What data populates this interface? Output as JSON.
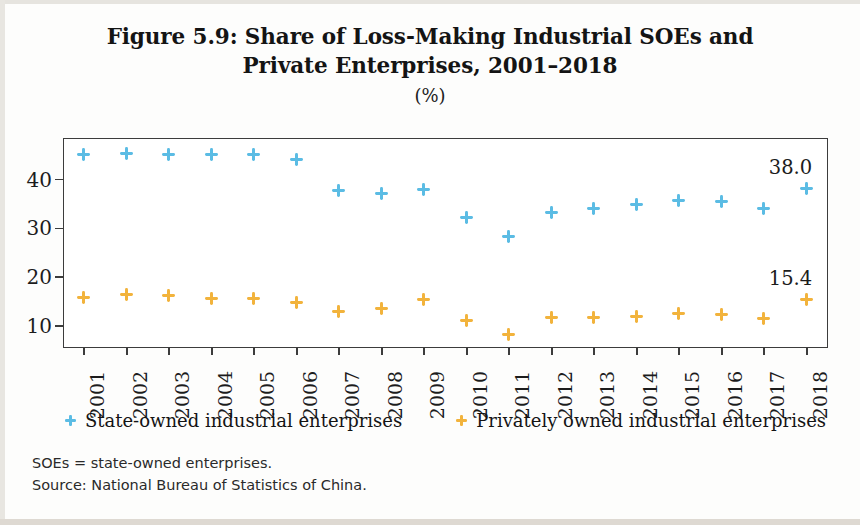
{
  "figure": {
    "title_line_1": "Figure 5.9: Share of Loss-Making Industrial SOEs and",
    "title_line_2": "Private Enterprises, 2001–2018",
    "subtitle": "(%)"
  },
  "footnotes": {
    "abbreviation": "SOEs = state-owned enterprises.",
    "source": "Source: National Bureau of Statistics of China."
  },
  "legend": {
    "items": [
      {
        "label": "State-owned industrial enterprises",
        "color": "#5BBCE4"
      },
      {
        "label": "Privately owned industrial enterprises",
        "color": "#F2B33C"
      }
    ]
  },
  "chart_data": {
    "type": "scatter",
    "title": "Figure 5.9: Share of Loss-Making Industrial SOEs and Private Enterprises, 2001–2018",
    "subtitle": "(%)",
    "xlabel": "",
    "ylabel": "",
    "categories": [
      "2001",
      "2002",
      "2003",
      "2004",
      "2005",
      "2006",
      "2007",
      "2008",
      "2009",
      "2010",
      "2011",
      "2012",
      "2013",
      "2014",
      "2015",
      "2016",
      "2017",
      "2018"
    ],
    "x_tick_labels": [
      "2001",
      "2002",
      "2003",
      "2004",
      "2005",
      "2006",
      "2007",
      "2008",
      "2009",
      "2010",
      "2011",
      "2012",
      "2013",
      "2014",
      "2015",
      "2016",
      "2017",
      "2018"
    ],
    "y_tick_labels": [
      "10",
      "20",
      "30",
      "40"
    ],
    "y_ticks": [
      10,
      20,
      30,
      40
    ],
    "ylim": [
      5.5,
      48.5
    ],
    "grid": false,
    "legend_position": "bottom",
    "series": [
      {
        "name": "State-owned industrial enterprises",
        "color": "#5BBCE4",
        "values": [
          44.9,
          45.2,
          45.1,
          44.9,
          44.9,
          43.9,
          37.6,
          37.1,
          37.9,
          32.2,
          28.2,
          33.2,
          34.0,
          34.8,
          35.6,
          35.4,
          33.9,
          38.0
        ]
      },
      {
        "name": "Privately owned industrial enterprises",
        "color": "#F2B33C",
        "values": [
          15.7,
          16.4,
          16.1,
          15.6,
          15.6,
          14.7,
          12.8,
          13.5,
          15.3,
          11.0,
          8.1,
          11.6,
          11.6,
          11.8,
          12.5,
          12.3,
          11.4,
          15.4
        ]
      }
    ],
    "endpoint_labels": [
      {
        "series": "State-owned industrial enterprises",
        "category": "2018",
        "text": "38.0"
      },
      {
        "series": "Privately owned industrial enterprises",
        "category": "2018",
        "text": "15.4"
      }
    ]
  }
}
